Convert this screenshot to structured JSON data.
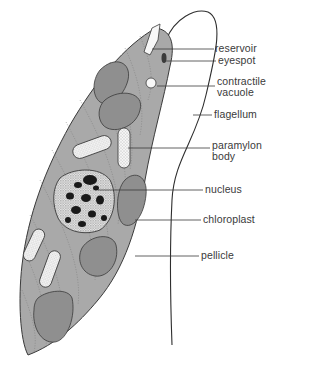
{
  "diagram": {
    "colors": {
      "body_fill": "#a9a9a9",
      "chloroplast_fill": "#8f8f8f",
      "paramylon_fill": "#f2f2f2",
      "nucleus_fill": "#d8d8d8",
      "nucleus_spots": "#1a1a1a",
      "outline": "#3a3a3a",
      "leader_line": "#3a3a3a",
      "label_text": "#3a3a3a"
    },
    "labels": [
      {
        "id": "reservoir",
        "lines": [
          "reservoir"
        ]
      },
      {
        "id": "eyespot",
        "lines": [
          "eyespot"
        ]
      },
      {
        "id": "contractile-vacuole",
        "lines": [
          "contractile",
          "vacuole"
        ]
      },
      {
        "id": "flagellum",
        "lines": [
          "flagellum"
        ]
      },
      {
        "id": "paramylon-body",
        "lines": [
          "paramylon",
          "body"
        ]
      },
      {
        "id": "nucleus",
        "lines": [
          "nucleus"
        ]
      },
      {
        "id": "chloroplast",
        "lines": [
          "chloroplast"
        ]
      },
      {
        "id": "pellicle",
        "lines": [
          "pellicle"
        ]
      }
    ]
  }
}
